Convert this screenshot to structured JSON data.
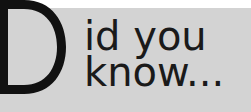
{
  "heading": {
    "drop_cap": "D",
    "line1": "id you",
    "line2": "know..."
  },
  "colors": {
    "background": "#d3d3d3",
    "top_strip": "#ffffff",
    "text": "#1a1a1a"
  }
}
